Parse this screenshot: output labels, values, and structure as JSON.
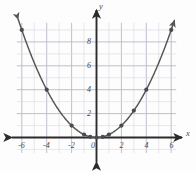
{
  "chart_data": {
    "type": "scatter",
    "title": "",
    "xlabel": "x",
    "ylabel": "y",
    "xlim": [
      -6.9,
      6.9
    ],
    "ylim": [
      -1.4,
      9.9
    ],
    "grid": true,
    "grid_step": 1,
    "major_step": 2,
    "legend": "none",
    "curve": {
      "label": "y = x^2/4",
      "arrows": [
        "start",
        "end"
      ],
      "color": "#555555"
    },
    "x_ticks": [
      -6,
      -4,
      -2,
      0,
      2,
      4,
      6
    ],
    "x_tick_labels": [
      "-6",
      "-4",
      "-2",
      "0",
      "2",
      "4",
      "6"
    ],
    "y_ticks": [
      2,
      4,
      6,
      8
    ],
    "y_tick_labels": [
      "2",
      "4",
      "6",
      "8"
    ],
    "origin_label": "0",
    "points": [
      {
        "x": -6,
        "y": 9
      },
      {
        "x": -4,
        "y": 4
      },
      {
        "x": -2,
        "y": 1
      },
      {
        "x": -1,
        "y": 0.25
      },
      {
        "x": -0.5,
        "y": 0.06
      },
      {
        "x": 0,
        "y": 0
      },
      {
        "x": 0.5,
        "y": 0.06
      },
      {
        "x": 1,
        "y": 0.25
      },
      {
        "x": 2,
        "y": 1
      },
      {
        "x": 3,
        "y": 2.25
      },
      {
        "x": 4,
        "y": 4
      },
      {
        "x": 6,
        "y": 9
      }
    ],
    "point_color": "#4a4a52",
    "axis_color": "#2b2b2b",
    "grid_color": "#d8d8e2",
    "major_grid_color": "#b9b9c8"
  }
}
